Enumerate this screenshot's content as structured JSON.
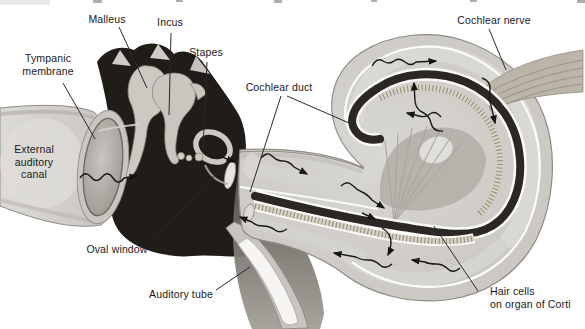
{
  "labels": {
    "malleus": "Malleus",
    "incus": "Incus",
    "stapes": "Stapes",
    "tympanic_membrane": "Tympanic\nmembrane",
    "external_auditory_canal": "External\nauditory\ncanal",
    "cochlear_duct": "Cochlear duct",
    "cochlear_nerve": "Cochlear nerve",
    "oval_window": "Oval window",
    "auditory_tube": "Auditory tube",
    "hair_cells": "Hair cells\non organ of Corti"
  },
  "palette": {
    "paper": "#ffffff",
    "ink": "#1a1a1a",
    "cavity_black": "#201d19",
    "tissue_light": "#d5d3cf",
    "tissue_mid": "#b7b4ae",
    "duct_dark": "#2b2723",
    "hatch_tan": "#8f8a7a",
    "nerve_tan": "#bab5a8",
    "shadow_gray": "#6e6963"
  }
}
